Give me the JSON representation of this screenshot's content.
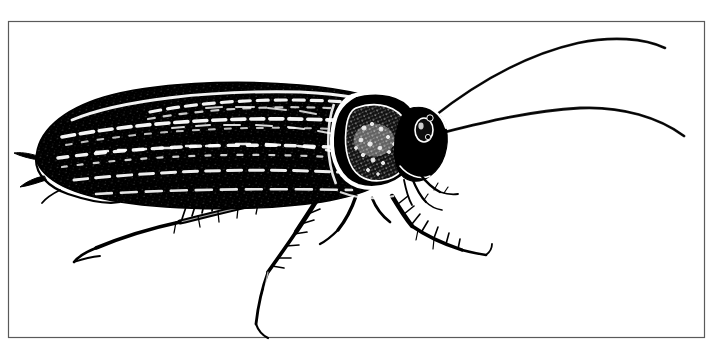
{
  "figure": {
    "title": "Cockroach",
    "subject_common_name": "Cockroach",
    "illustration_style": "pen-and-ink line engraving",
    "orientation": "lateral view, head facing right",
    "background_color": "#ffffff",
    "ink_color": "#000000",
    "border_color": "#5a5a5a",
    "canvas": {
      "width": 714,
      "height": 351
    },
    "frame": {
      "name": "rectangular-border",
      "left": 8,
      "top": 21,
      "right": 705,
      "bottom": 338,
      "stroke_width": 1.2
    },
    "parts": [
      {
        "name": "antenna-upper",
        "label": "Upper antenna"
      },
      {
        "name": "antenna-lower",
        "label": "Lower antenna"
      },
      {
        "name": "head",
        "label": "Head"
      },
      {
        "name": "compound-eye",
        "label": "Compound eye"
      },
      {
        "name": "maxillary-palps",
        "label": "Maxillary palps"
      },
      {
        "name": "pronotum",
        "label": "Pronotum"
      },
      {
        "name": "forewing",
        "label": "Forewing (tegmen)"
      },
      {
        "name": "abdomen",
        "label": "Abdomen"
      },
      {
        "name": "cerci",
        "label": "Cerci"
      },
      {
        "name": "foreleg",
        "label": "Foreleg"
      },
      {
        "name": "midleg",
        "label": "Midleg"
      },
      {
        "name": "hindleg",
        "label": "Hindleg"
      },
      {
        "name": "tibial-spines",
        "label": "Tibial spines"
      }
    ]
  }
}
